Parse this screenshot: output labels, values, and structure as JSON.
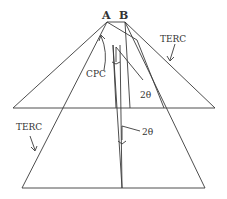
{
  "diagram": {
    "points": {
      "A": "A",
      "B": "B"
    },
    "labels": {
      "terc_upper": "TERC",
      "terc_lower": "TERC",
      "cpc": "CPC",
      "angle_upper": "2θ",
      "angle_lower": "2θ"
    },
    "line_color": "#3a3a3a"
  }
}
